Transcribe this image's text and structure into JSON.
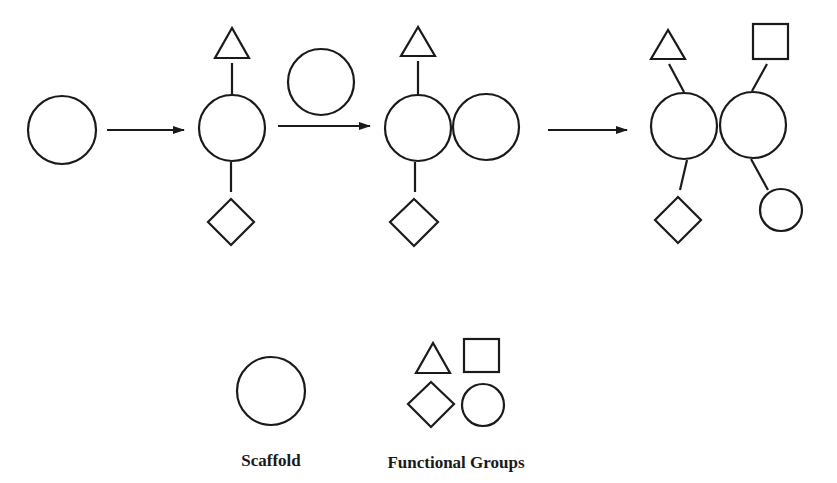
{
  "diagram": {
    "type": "scaffold-functionalization-scheme",
    "stroke_color": "#1a1a1a",
    "background": "#ffffff",
    "steps": [
      {
        "id": "step1",
        "description": "Bare scaffold",
        "scaffolds": 1,
        "functional_groups": []
      },
      {
        "id": "step2",
        "description": "Scaffold with triangle and diamond functional groups",
        "scaffolds": 1,
        "functional_groups": [
          "triangle",
          "diamond"
        ]
      },
      {
        "id": "step3",
        "description": "Second scaffold attached",
        "reagent_above_arrow": "scaffold",
        "scaffolds": 2,
        "functional_groups": [
          "triangle",
          "diamond"
        ]
      },
      {
        "id": "step4",
        "description": "Dimer with four functional groups",
        "scaffolds": 2,
        "functional_groups": [
          "triangle",
          "square",
          "diamond",
          "circle"
        ]
      }
    ],
    "arrows": 3
  },
  "legend": {
    "scaffold_label": "Scaffold",
    "functional_groups_label": "Functional Groups",
    "functional_group_shapes": [
      "triangle",
      "square",
      "diamond",
      "circle"
    ]
  }
}
